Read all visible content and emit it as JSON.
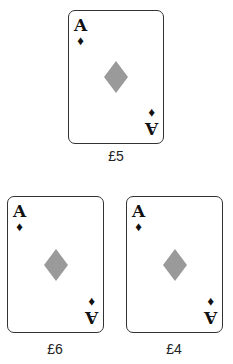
{
  "cards": [
    {
      "rank": "A",
      "suit_symbol": "♦",
      "suit": "diamonds",
      "price": "£5"
    },
    {
      "rank": "A",
      "suit_symbol": "♦",
      "suit": "diamonds",
      "price": "£6"
    },
    {
      "rank": "A",
      "suit_symbol": "♦",
      "suit": "diamonds",
      "price": "£4"
    }
  ],
  "colors": {
    "pip": "#9a9a9a",
    "corner": "#111111",
    "border": "#333333"
  }
}
